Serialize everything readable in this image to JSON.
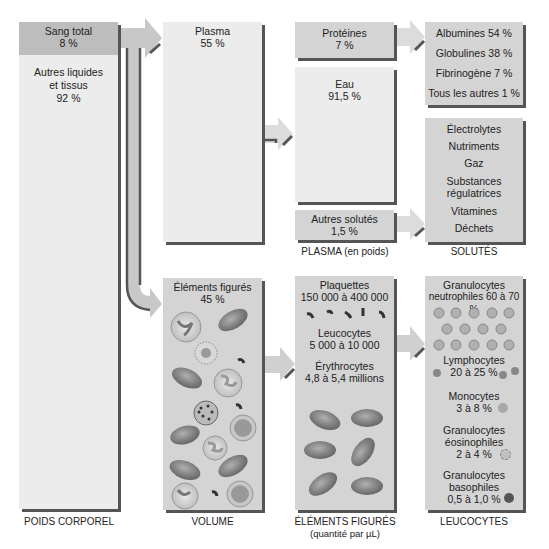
{
  "columns": {
    "poids_corporel": {
      "label": "POIDS CORPOREL",
      "sang_total": {
        "name": "Sang total",
        "value": "8 %"
      },
      "autres": {
        "name_line1": "Autres liquides",
        "name_line2": "et tissus",
        "value": "92 %"
      }
    },
    "volume": {
      "label": "VOLUME",
      "plasma": {
        "name": "Plasma",
        "value": "55 %"
      },
      "elements_figures": {
        "name": "Éléments figurés",
        "value": "45 %"
      }
    },
    "plasma": {
      "label": "PLASMA (en poids)",
      "proteines": {
        "name": "Protéines",
        "value": "7 %"
      },
      "eau": {
        "name": "Eau",
        "value": "91,5 %"
      },
      "autres_solutes": {
        "name": "Autres solutés",
        "value": "1,5 %"
      }
    },
    "solutes": {
      "label": "SOLUTÉS",
      "proteins_list": [
        "Albumines 54 %",
        "Globulines 38 %",
        "Fibrinogène 7 %",
        "Tous les autres 1 %"
      ],
      "others_list": [
        "Électrolytes",
        "Nutriments",
        "Gaz",
        "Substances",
        "régulatrices",
        "Vitamines",
        "Déchets"
      ]
    },
    "elements_figures": {
      "label": "ÉLÉMENTS FIGURÉS",
      "sublabel": "(quantité par µL)",
      "plaquettes": {
        "name": "Plaquettes",
        "value": "150 000 à 400 000"
      },
      "leucocytes": {
        "name": "Leucocytes",
        "value": "5 000 à 10 000"
      },
      "erythrocytes": {
        "name": "Érythrocytes",
        "value": "4,8 à 5,4 millions"
      }
    },
    "leucocytes": {
      "label": "LEUCOCYTES",
      "neutrophiles": {
        "line1": "Granulocytes",
        "line2": "neutrophiles 60 à 70 %"
      },
      "lymphocytes": {
        "line1": "Lymphocytes",
        "line2": "20 à 25 %"
      },
      "monocytes": {
        "line1": "Monocytes",
        "line2": "3 à 8 %"
      },
      "eosinophiles": {
        "line1": "Granulocytes",
        "line2": "éosinophiles",
        "line3": "2 à 4 %"
      },
      "basophiles": {
        "line1": "Granulocytes",
        "line2": "basophiles",
        "line3": "0,5 à 1,0 %"
      }
    }
  },
  "colors": {
    "box_light": "#ececec",
    "box_mid": "#d4d4d4",
    "box_dark": "#bdbdbd",
    "shadow": "#555555",
    "rbc": "#8a8a8a"
  }
}
